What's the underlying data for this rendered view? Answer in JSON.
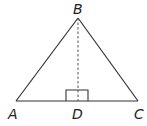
{
  "figure": {
    "type": "triangle-with-altitude",
    "points": {
      "A": {
        "label": "A"
      },
      "B": {
        "label": "B"
      },
      "C": {
        "label": "C"
      },
      "D": {
        "label": "D"
      }
    },
    "segments": [
      {
        "from": "A",
        "to": "B",
        "style": "solid"
      },
      {
        "from": "B",
        "to": "C",
        "style": "solid"
      },
      {
        "from": "A",
        "to": "C",
        "style": "solid"
      },
      {
        "from": "B",
        "to": "D",
        "style": "dashed"
      }
    ],
    "right_angle_at": "D",
    "colors": {
      "stroke": "#333333",
      "label": "#222222",
      "background": "#ffffff"
    }
  }
}
